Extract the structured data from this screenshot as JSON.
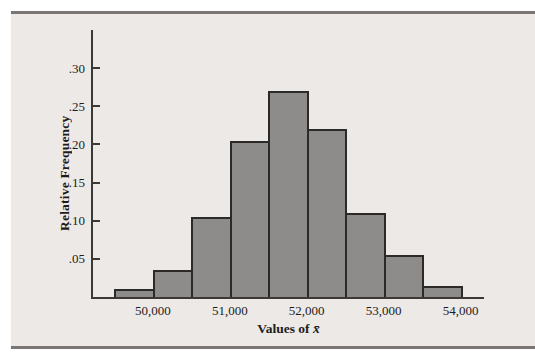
{
  "figure": {
    "page_background": "#FFFFFF",
    "panel_background": "#ECE9E7",
    "rule_color": "#7B7673",
    "bar_fill": "#8E8C8B",
    "bar_border": "#2B2A29",
    "axis_color": "#3B3937",
    "text_color": "#1E1C1B"
  },
  "chart_data": {
    "type": "bar",
    "subtype": "histogram",
    "title": "",
    "xlabel": "Values of x̄",
    "xlabel_parts": {
      "prefix": "Values of ",
      "symbol": "x̄"
    },
    "ylabel": "Relative Frequency",
    "bin_edges": [
      49500,
      50000,
      50500,
      51000,
      51500,
      52000,
      52500,
      53000,
      53500,
      54000
    ],
    "values": [
      0.01,
      0.035,
      0.105,
      0.205,
      0.27,
      0.22,
      0.11,
      0.055,
      0.015
    ],
    "x_tick_values": [
      50000,
      51000,
      52000,
      53000,
      54000
    ],
    "x_tick_labels": [
      "50,000",
      "51,000",
      "52,000",
      "53,000",
      "54,000"
    ],
    "y_tick_values": [
      0.05,
      0.1,
      0.15,
      0.2,
      0.25,
      0.3
    ],
    "y_tick_labels": [
      ".05",
      ".10",
      ".15",
      ".20",
      ".25",
      ".30"
    ],
    "xlim": [
      49221,
      54305
    ],
    "ylim": [
      0,
      0.35
    ],
    "grid": false,
    "legend": null
  }
}
